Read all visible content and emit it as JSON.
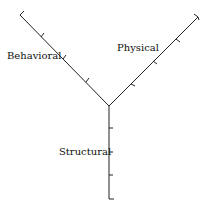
{
  "diagram": {
    "type": "Y-chart",
    "axes": [
      {
        "name": "Behavioral",
        "direction": "upper-left",
        "ticks": 3
      },
      {
        "name": "Physical",
        "direction": "upper-right",
        "ticks": 3
      },
      {
        "name": "Structural",
        "direction": "down",
        "ticks": 3
      }
    ]
  },
  "labels": {
    "behavioral": "Behavioral",
    "physical": "Physical",
    "structural": "Structural"
  },
  "colors": {
    "line": "#222222",
    "background": "#ffffff"
  }
}
